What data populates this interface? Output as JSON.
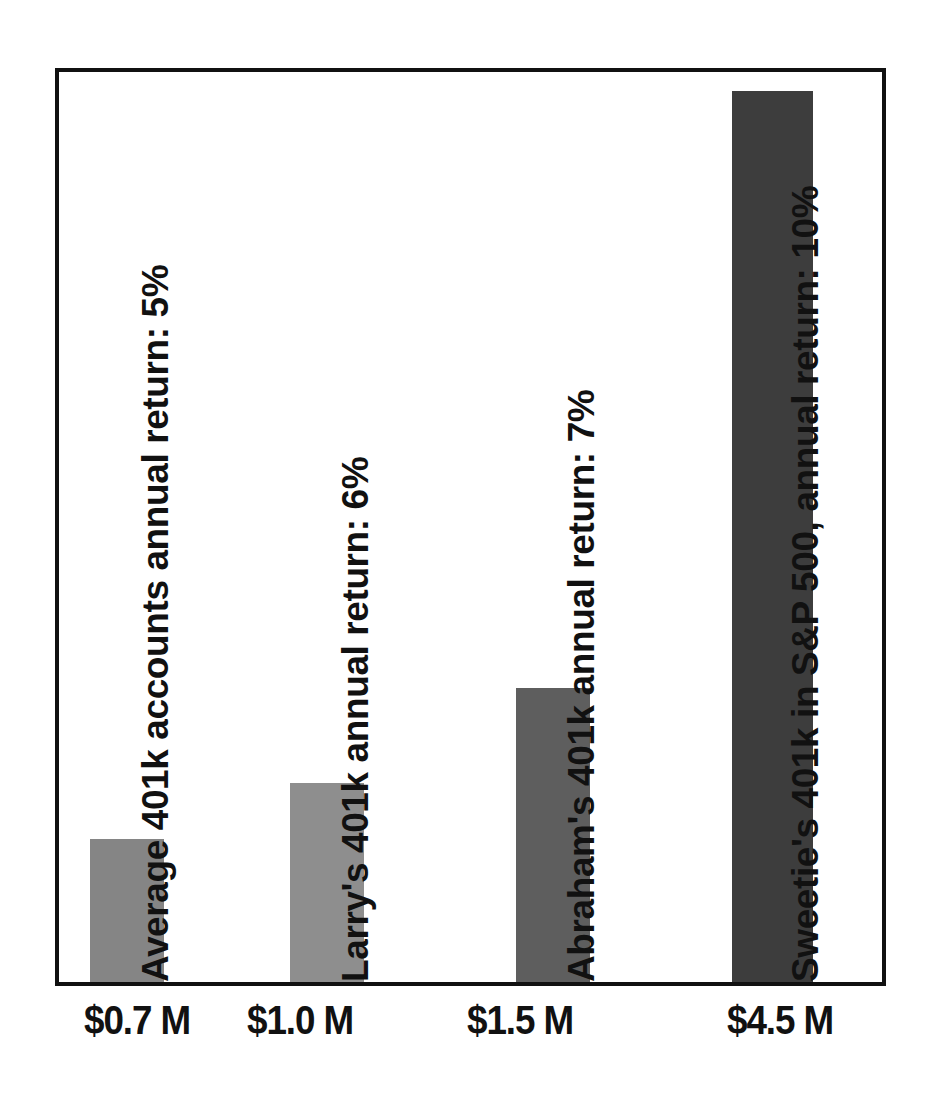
{
  "chart_data": {
    "type": "bar",
    "title": "",
    "subtitle": "",
    "xlabel": "",
    "ylabel": "",
    "grid": false,
    "legend_position": "none",
    "ylim": [
      0,
      5.0
    ],
    "categories": [
      "$0.7 M",
      "$1.0 M",
      "$1.5 M",
      "$4.5 M"
    ],
    "values": [
      0.7,
      1.0,
      1.5,
      4.5
    ],
    "value_unit": "millions of dollars",
    "tick_labels": [
      "$0.7 M",
      "$1.0 M",
      "$1.5 M",
      "$4.5 M"
    ],
    "annotations": [
      "Average 401k accounts annual return: 5%",
      "Larry's 401k annual return: 6%",
      "Abraham's 401k annual return: 7%",
      "Sweetie's 401k in S&P 500, annual return: 10%"
    ],
    "annual_returns_pct": [
      5,
      6,
      7,
      10
    ],
    "bar_colors": [
      "#858585",
      "#8e8e8e",
      "#5e5e5e",
      "#3d3d3d"
    ],
    "frame_color": "#111111",
    "background_color": "#ffffff"
  },
  "bars": [
    {
      "id": "bar-average-401k",
      "tick_label": "$0.7 M",
      "value": 0.7,
      "annotation": "Average 401k accounts annual return: 5%",
      "annual_return_pct": 5,
      "color": "#858585"
    },
    {
      "id": "bar-larry-401k",
      "tick_label": "$1.0 M",
      "value": 1.0,
      "annotation": "Larry's 401k annual return: 6%",
      "annual_return_pct": 6,
      "color": "#8e8e8e"
    },
    {
      "id": "bar-abraham-401k",
      "tick_label": "$1.5 M",
      "value": 1.5,
      "annotation": "Abraham's 401k annual return: 7%",
      "annual_return_pct": 7,
      "color": "#5e5e5e"
    },
    {
      "id": "bar-sweetie-sp500",
      "tick_label": "$4.5 M",
      "value": 4.5,
      "annotation": "Sweetie's 401k in S&P 500, annual return: 10%",
      "annual_return_pct": 10,
      "color": "#3d3d3d"
    }
  ],
  "geometry": {
    "bars_px": [
      {
        "left": 31,
        "width": 74,
        "height": 143,
        "label_left": 115,
        "label_max_height": 790
      },
      {
        "left": 231,
        "width": 74,
        "height": 199,
        "label_left": 315,
        "label_max_height": 690
      },
      {
        "left": 457,
        "width": 74,
        "height": 294,
        "label_left": 541,
        "label_max_height": 680
      },
      {
        "left": 673,
        "width": 81,
        "height": 891,
        "label_left": 765,
        "label_max_height": 860
      }
    ],
    "x_ticks_px": [
      {
        "center": 82,
        "width": 220
      },
      {
        "center": 245,
        "width": 220
      },
      {
        "center": 465,
        "width": 220
      },
      {
        "center": 725,
        "width": 220
      }
    ]
  }
}
